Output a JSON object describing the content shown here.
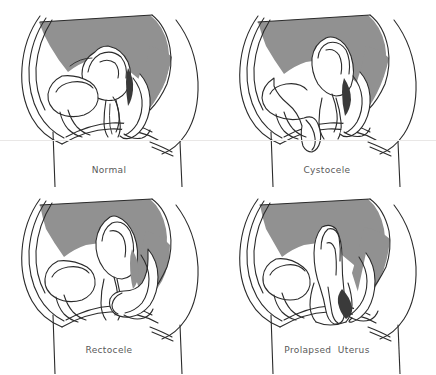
{
  "figure": {
    "background_color": "#ffffff",
    "line_color": "#2b2b2b",
    "cavity_fill_color": "#919191",
    "organ_fill_color": "#ffffff",
    "label_color": "#595959",
    "width": 436,
    "height": 375,
    "grid": {
      "rows": 2,
      "columns": 2
    }
  },
  "panels": [
    {
      "id": "normal",
      "label": "Normal",
      "position": "top-left",
      "description": "Sagittal section of the female pelvis showing normal anatomical position of bladder, uterus, vagina and rectum."
    },
    {
      "id": "cystocele",
      "label": "Cystocele",
      "position": "top-right",
      "description": "Bladder herniates downward into the anterior vaginal wall."
    },
    {
      "id": "rectocele",
      "label": "Rectocele",
      "position": "bottom-left",
      "description": "Rectum bulges forward into the posterior vaginal wall."
    },
    {
      "id": "prolapsed-uterus",
      "label": "Prolapsed  Uterus",
      "position": "bottom-right",
      "description": "Uterus descends through the vaginal canal toward the introitus."
    }
  ]
}
